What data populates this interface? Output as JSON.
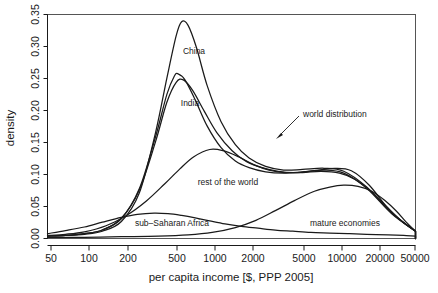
{
  "chart_data": {
    "type": "line",
    "title": "",
    "xlabel": "per capita income [$, PPP 2005]",
    "ylabel": "density",
    "x_scale": "log",
    "xlim": [
      50,
      50000
    ],
    "ylim": [
      0.0,
      0.37
    ],
    "grid": false,
    "legend": "inline-curve-labels",
    "x_ticks": [
      50,
      100,
      200,
      500,
      1000,
      2000,
      5000,
      10000,
      20000,
      50000
    ],
    "x_tick_labels": [
      "50",
      "100",
      "200",
      "500",
      "1000",
      "2000",
      "5000",
      "10000",
      "20000",
      "50000"
    ],
    "y_ticks": [
      0.0,
      0.05,
      0.1,
      0.15,
      0.2,
      0.25,
      0.3,
      0.35
    ],
    "y_tick_labels": [
      "0.00",
      "0.05",
      "0.10",
      "0.15",
      "0.20",
      "0.25",
      "0.30",
      "0.35"
    ],
    "annotations": [
      {
        "text": "world distribution",
        "points_to_series": "world distribution"
      }
    ],
    "series": [
      {
        "name": "China",
        "label": "China",
        "peak_x": 620,
        "peak_y": 0.358,
        "x": [
          50,
          70,
          100,
          140,
          200,
          280,
          380,
          470,
          560,
          620,
          700,
          820,
          1000,
          1300,
          1700,
          2200,
          3000,
          4200,
          6000,
          9000,
          13000,
          20000,
          32000,
          50000
        ],
        "y": [
          0.004,
          0.005,
          0.007,
          0.012,
          0.028,
          0.075,
          0.175,
          0.265,
          0.335,
          0.358,
          0.352,
          0.315,
          0.253,
          0.193,
          0.155,
          0.133,
          0.119,
          0.113,
          0.114,
          0.116,
          0.111,
          0.085,
          0.042,
          0.012
        ]
      },
      {
        "name": "India",
        "label": "India",
        "peak_x": 580,
        "peak_y": 0.272,
        "x": [
          50,
          70,
          100,
          140,
          200,
          280,
          380,
          470,
          540,
          580,
          660,
          800,
          1000,
          1300,
          1700,
          2200,
          3000,
          4200,
          6000,
          9000,
          13000,
          20000,
          32000,
          50000
        ],
        "y": [
          0.004,
          0.005,
          0.008,
          0.014,
          0.033,
          0.082,
          0.168,
          0.238,
          0.268,
          0.272,
          0.262,
          0.229,
          0.186,
          0.15,
          0.128,
          0.117,
          0.11,
          0.108,
          0.11,
          0.113,
          0.108,
          0.083,
          0.041,
          0.012
        ]
      },
      {
        "name": "world distribution",
        "label": "world distribution",
        "x": [
          50,
          70,
          100,
          140,
          200,
          280,
          380,
          470,
          560,
          640,
          760,
          950,
          1200,
          1600,
          2100,
          2800,
          3800,
          5200,
          7500,
          11000,
          15000,
          21000,
          32000,
          50000
        ],
        "y": [
          0.004,
          0.005,
          0.008,
          0.014,
          0.033,
          0.08,
          0.16,
          0.225,
          0.258,
          0.262,
          0.245,
          0.21,
          0.175,
          0.145,
          0.127,
          0.117,
          0.111,
          0.109,
          0.112,
          0.116,
          0.112,
          0.088,
          0.043,
          0.012
        ]
      },
      {
        "name": "rest of the world",
        "label": "rest of the world",
        "peak_x": 1050,
        "peak_y": 0.147,
        "x": [
          50,
          70,
          100,
          150,
          220,
          320,
          450,
          600,
          780,
          1050,
          1350,
          1800,
          2400,
          3200,
          4300,
          6000,
          8500,
          12000,
          16000,
          22000,
          30000,
          40000,
          50000
        ],
        "y": [
          0.005,
          0.007,
          0.011,
          0.021,
          0.038,
          0.062,
          0.09,
          0.115,
          0.135,
          0.147,
          0.145,
          0.135,
          0.122,
          0.113,
          0.109,
          0.109,
          0.111,
          0.108,
          0.098,
          0.077,
          0.05,
          0.026,
          0.012
        ]
      },
      {
        "name": "sub-Saharan Africa",
        "label": "sub–Saharan Africa",
        "peak_x": 370,
        "peak_y": 0.042,
        "x": [
          50,
          70,
          100,
          140,
          200,
          270,
          370,
          480,
          620,
          800,
          1050,
          1400,
          1900,
          2600,
          3600,
          5000,
          7000,
          10000,
          14000,
          20000,
          30000,
          40000,
          50000
        ],
        "y": [
          0.008,
          0.013,
          0.019,
          0.027,
          0.035,
          0.04,
          0.042,
          0.041,
          0.038,
          0.034,
          0.029,
          0.024,
          0.02,
          0.017,
          0.014,
          0.012,
          0.01,
          0.009,
          0.008,
          0.007,
          0.006,
          0.005,
          0.004
        ]
      },
      {
        "name": "mature economies",
        "label": "mature economies",
        "peak_x": 13000,
        "peak_y": 0.088,
        "x": [
          50,
          100,
          200,
          400,
          700,
          1100,
          1700,
          2500,
          3600,
          5200,
          7500,
          10000,
          13000,
          17000,
          22000,
          28000,
          35000,
          42000,
          50000
        ],
        "y": [
          0.002,
          0.002,
          0.003,
          0.004,
          0.006,
          0.01,
          0.018,
          0.03,
          0.046,
          0.063,
          0.078,
          0.085,
          0.088,
          0.086,
          0.078,
          0.063,
          0.045,
          0.027,
          0.012
        ]
      }
    ]
  },
  "axes": {
    "x_title": "per capita income [$, PPP 2005]",
    "y_title": "density"
  },
  "colors": {
    "curve": "#1a1a1a",
    "frame": "#555555",
    "background": "#ffffff",
    "text": "#1a1a1a"
  },
  "labels": {
    "china": "China",
    "india": "India",
    "rest_of_world": "rest of the world",
    "sub_saharan_africa": "sub–Saharan Africa",
    "mature_economies": "mature economies",
    "world_distribution": "world distribution"
  },
  "y_tick_values": {
    "t0": "0.00",
    "t1": "0.05",
    "t2": "0.10",
    "t3": "0.15",
    "t4": "0.20",
    "t5": "0.25",
    "t6": "0.30",
    "t7": "0.35"
  },
  "x_tick_values": {
    "t0": "50",
    "t1": "100",
    "t2": "200",
    "t3": "500",
    "t4": "1000",
    "t5": "2000",
    "t6": "5000",
    "t7": "10000",
    "t8": "20000",
    "t9": "50000"
  }
}
